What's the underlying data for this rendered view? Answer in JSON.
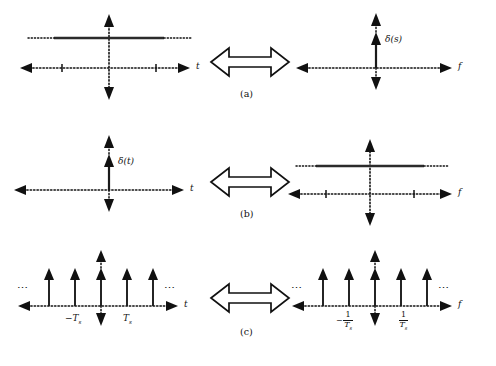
{
  "figure": {
    "type": "signal-transform-pairs",
    "rows": [
      {
        "tag": "(a)",
        "relation_icon": "double-arrow-icon",
        "left": {
          "domain_label": "t",
          "signal": "constant",
          "signal_label": "",
          "tick_labels": [
            "",
            ""
          ],
          "ellipses": [
            "",
            ""
          ]
        },
        "right": {
          "domain_label": "f",
          "signal": "impulse",
          "signal_label": "δ(s)",
          "tick_labels": [],
          "ellipses": [
            "",
            ""
          ]
        }
      },
      {
        "tag": "(b)",
        "relation_icon": "double-arrow-icon",
        "left": {
          "domain_label": "t",
          "signal": "impulse",
          "signal_label": "δ(t)",
          "tick_labels": [],
          "ellipses": [
            "",
            ""
          ]
        },
        "right": {
          "domain_label": "f",
          "signal": "constant",
          "signal_label": "",
          "tick_labels": [
            "",
            ""
          ],
          "ellipses": [
            "",
            ""
          ]
        }
      },
      {
        "tag": "(c)",
        "relation_icon": "double-arrow-icon",
        "left": {
          "domain_label": "t",
          "signal": "impulse-train",
          "signal_label": "",
          "impulse_count": 5,
          "tick_label_negative": "−T",
          "tick_label_negative_sub": "s",
          "tick_label_positive": "T",
          "tick_label_positive_sub": "s",
          "ellipsis_left": "⋯",
          "ellipsis_right": "⋯"
        },
        "right": {
          "domain_label": "f",
          "signal": "impulse-train",
          "signal_label": "",
          "impulse_count": 5,
          "frac_negative_sign": "−",
          "frac_negative_num": "1",
          "frac_negative_den": "T",
          "frac_negative_den_sub": "s",
          "frac_positive_sign": "",
          "frac_positive_num": "1",
          "frac_positive_den": "T",
          "frac_positive_den_sub": "s",
          "ellipsis_left": "⋯",
          "ellipsis_right": "⋯"
        }
      }
    ],
    "colors": {
      "ink": "#111111",
      "line": "#1a1a1a",
      "background": "#ffffff"
    }
  }
}
